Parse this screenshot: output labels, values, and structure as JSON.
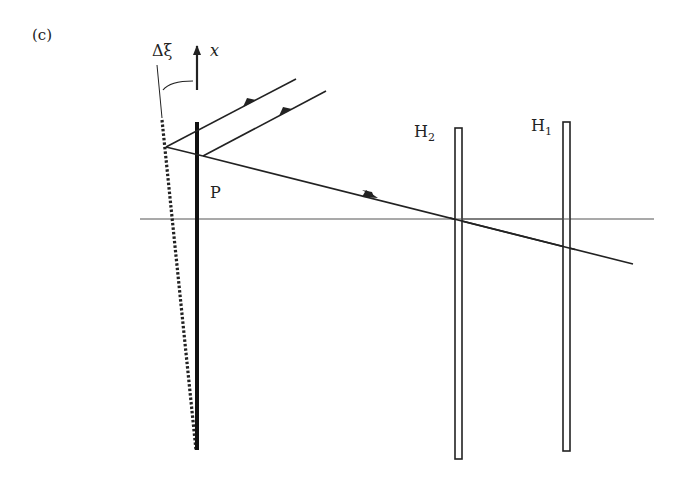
{
  "figure": {
    "panel_label": "(c)",
    "labels": {
      "tilt_angle": "Δξ",
      "axis": "x",
      "plate": "P",
      "hologram_2_base": "H",
      "hologram_2_sub": "2",
      "hologram_1_base": "H",
      "hologram_1_sub": "1"
    },
    "colors": {
      "ink": "#222222",
      "axis_line": "#555555",
      "background": "#ffffff"
    }
  }
}
